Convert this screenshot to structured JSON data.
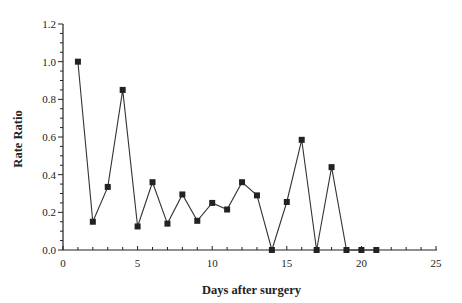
{
  "chart_data": {
    "type": "line",
    "title": "",
    "xlabel": "Days after surgery",
    "ylabel": "Rate Ratio",
    "xlim": [
      0,
      25
    ],
    "ylim": [
      0,
      1.2
    ],
    "x_ticks": [
      0,
      5,
      10,
      15,
      20,
      25
    ],
    "x_tick_labels": [
      "0",
      "5",
      "10",
      "15",
      "20",
      "25"
    ],
    "x_minor_step": 1,
    "y_ticks": [
      0,
      0.2,
      0.4,
      0.6,
      0.8,
      1.0,
      1.2
    ],
    "y_tick_labels": [
      "0.0",
      "0.2",
      "0.4",
      "0.6",
      "0.8",
      "1.0",
      "1.2"
    ],
    "y_minor_step": 0.05,
    "grid": false,
    "legend": null,
    "marker": "square",
    "series": [
      {
        "name": "Rate Ratio",
        "x": [
          1,
          2,
          3,
          4,
          5,
          6,
          7,
          8,
          9,
          10,
          11,
          12,
          13,
          14,
          15,
          16,
          17,
          18,
          19,
          20,
          21
        ],
        "y": [
          1.0,
          0.15,
          0.335,
          0.85,
          0.125,
          0.36,
          0.14,
          0.295,
          0.155,
          0.25,
          0.215,
          0.36,
          0.29,
          0.0,
          0.255,
          0.585,
          0.0,
          0.44,
          0.0,
          0.0,
          0.0
        ]
      }
    ]
  }
}
